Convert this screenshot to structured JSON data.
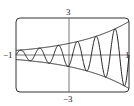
{
  "chart_data": {
    "type": "line",
    "title": "",
    "xlabel": "",
    "ylabel": "",
    "xlim": [
      -1,
      1
    ],
    "ylim": [
      -3,
      3
    ],
    "tick_labels": {
      "x_min": "−1",
      "x_max": "1",
      "y_max": "3",
      "y_min": "−3"
    },
    "grid": false,
    "series": [
      {
        "name": "y = e^x",
        "expr": "exp(x)"
      },
      {
        "name": "y = -e^x",
        "expr": "-exp(x)"
      },
      {
        "name": "y = e^x sin(6πx)",
        "expr": "exp(x)*sin(6*pi*x)"
      }
    ]
  },
  "labels": {
    "ytop": "3",
    "ybottom": "−3",
    "xleft": "−1",
    "xright": "1"
  }
}
